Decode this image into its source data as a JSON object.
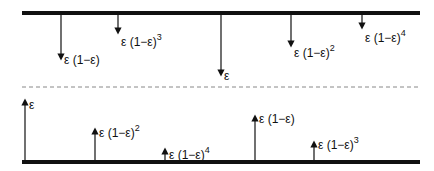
{
  "diagram": {
    "top_bar": {
      "x1": 22,
      "x2": 420,
      "y": 13
    },
    "bottom_bar": {
      "x1": 22,
      "x2": 420,
      "y": 162
    },
    "divider": {
      "x1": 22,
      "x2": 420,
      "y": 87
    },
    "top_arrows": [
      {
        "x": 61,
        "len": 42,
        "label": "ε (1−ε)",
        "exp": "",
        "lx": 64,
        "ly": 54
      },
      {
        "x": 118,
        "len": 16,
        "label": "ε (1−ε)",
        "exp": "3",
        "lx": 121,
        "ly": 33
      },
      {
        "x": 221,
        "len": 58,
        "label": "ε",
        "exp": "",
        "lx": 224,
        "ly": 70
      },
      {
        "x": 291,
        "len": 29,
        "label": "ε (1−ε)",
        "exp": "2",
        "lx": 294,
        "ly": 44
      },
      {
        "x": 362,
        "len": 11,
        "label": "ε (1−ε)",
        "exp": "4",
        "lx": 365,
        "ly": 29
      }
    ],
    "bottom_arrows": [
      {
        "x": 25,
        "len": 58,
        "label": "ε",
        "exp": "",
        "lx": 29,
        "ly": 99
      },
      {
        "x": 95,
        "len": 29,
        "label": "ε (1−ε)",
        "exp": "2",
        "lx": 99,
        "ly": 124
      },
      {
        "x": 165,
        "len": 9,
        "label": "ε (1−ε)",
        "exp": "4",
        "lx": 169,
        "ly": 146
      },
      {
        "x": 255,
        "len": 42,
        "label": "ε (1−ε)",
        "exp": "",
        "lx": 259,
        "ly": 113
      },
      {
        "x": 314,
        "len": 16,
        "label": "ε (1−ε)",
        "exp": "3",
        "lx": 318,
        "ly": 136
      }
    ]
  }
}
